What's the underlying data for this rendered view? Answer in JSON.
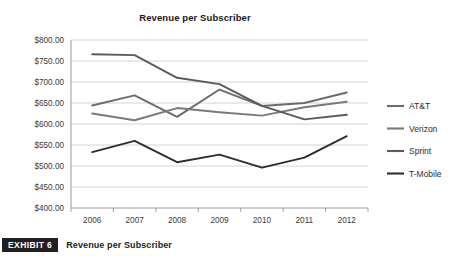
{
  "chart_data": {
    "type": "line",
    "title": "Revenue per Subscriber",
    "xlabel": "",
    "ylabel": "",
    "x": [
      2006,
      2007,
      2008,
      2009,
      2010,
      2011,
      2012
    ],
    "categories": [
      "2006",
      "2007",
      "2008",
      "2009",
      "2010",
      "2011",
      "2012"
    ],
    "ylim": [
      400,
      800
    ],
    "ytick_step": 50,
    "ytick_labels": [
      "$800.00",
      "$750.00",
      "$700.00",
      "$650.00",
      "$600.00",
      "$550.00",
      "$500.00",
      "$450.00",
      "$400.00"
    ],
    "ytick_values": [
      800,
      750,
      700,
      650,
      600,
      550,
      500,
      450,
      400
    ],
    "grid": true,
    "legend_position": "right",
    "series": [
      {
        "name": "AT&T",
        "color": "#6b6b6b",
        "values": [
          644,
          668,
          617,
          682,
          643,
          650,
          675
        ]
      },
      {
        "name": "Verizon",
        "color": "#7a7a7a",
        "values": [
          625,
          609,
          638,
          628,
          620,
          640,
          653
        ]
      },
      {
        "name": "Sprint",
        "color": "#5a5a5a",
        "values": [
          766,
          764,
          710,
          695,
          643,
          611,
          622
        ]
      },
      {
        "name": "T-Mobile",
        "color": "#2e2e2e",
        "values": [
          533,
          560,
          509,
          527,
          496,
          520,
          571
        ]
      }
    ]
  },
  "exhibit": {
    "badge": "EXHIBIT 6",
    "caption": "Revenue per Subscriber"
  }
}
